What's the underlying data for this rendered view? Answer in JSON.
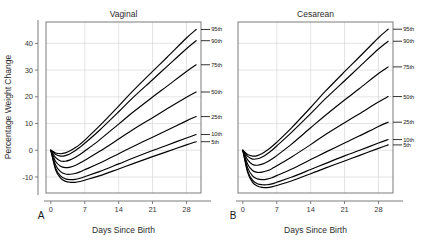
{
  "figure": {
    "background_color": "#ffffff",
    "curve_color": "#000000",
    "grid_color": "#d9d9d9",
    "axis_color": "#6e6e6e"
  },
  "panels": [
    {
      "letter": "A",
      "title": "Vaginal",
      "xlabel": "Days Since Birth",
      "ylabel": "Percentage Weight Change"
    },
    {
      "letter": "B",
      "title": "Cesarean",
      "xlabel": "Days Since Birth",
      "ylabel": ""
    }
  ],
  "chart_data": {
    "type": "line",
    "xlabel": "Days Since Birth",
    "ylabel": "Percentage Weight Change",
    "xlim": [
      -1,
      31
    ],
    "ylim": [
      -16,
      48
    ],
    "xticks": [
      0,
      7,
      14,
      21,
      28
    ],
    "yticks": [
      -10,
      0,
      10,
      20,
      30,
      40
    ],
    "grid": true,
    "legend_position": "inline-right-of-curve-ends",
    "x": [
      0,
      1,
      2,
      3,
      4,
      5,
      6,
      7,
      10,
      14,
      17,
      21,
      24,
      28,
      30
    ],
    "panels": [
      {
        "name": "Vaginal",
        "letter": "A",
        "series": [
          {
            "name": "95th",
            "label": "95th",
            "values": [
              0,
              -1.0,
              -1.3,
              -1.0,
              -0.2,
              0.9,
              2.2,
              3.8,
              9.0,
              16.5,
              22.3,
              29.5,
              34.8,
              42.0,
              45.2
            ]
          },
          {
            "name": "90th",
            "label": "90th",
            "values": [
              0,
              -1.6,
              -2.2,
              -2.0,
              -1.3,
              -0.2,
              1.1,
              2.6,
              7.4,
              14.4,
              19.8,
              26.4,
              31.4,
              38.0,
              41.0
            ]
          },
          {
            "name": "75th",
            "label": "75th",
            "values": [
              0,
              -2.8,
              -4.0,
              -4.1,
              -3.6,
              -2.7,
              -1.6,
              -0.3,
              3.8,
              9.8,
              14.3,
              19.9,
              24.0,
              29.5,
              32.0
            ]
          },
          {
            "name": "50th",
            "label": "50th",
            "values": [
              0,
              -4.2,
              -6.0,
              -6.5,
              -6.3,
              -5.7,
              -4.8,
              -3.7,
              -0.5,
              4.2,
              7.8,
              12.2,
              15.5,
              19.8,
              21.8
            ]
          },
          {
            "name": "25th",
            "label": "25th",
            "values": [
              0,
              -5.6,
              -8.0,
              -8.9,
              -9.0,
              -8.7,
              -8.1,
              -7.3,
              -4.9,
              -1.3,
              1.4,
              4.9,
              7.5,
              11.0,
              12.6
            ]
          },
          {
            "name": "10th",
            "label": "10th",
            "values": [
              0,
              -6.8,
              -9.6,
              -10.7,
              -11.0,
              -10.9,
              -10.5,
              -9.9,
              -8.0,
              -5.1,
              -2.9,
              -0.1,
              1.9,
              4.6,
              5.9
            ]
          },
          {
            "name": "5th",
            "label": "5th",
            "values": [
              0,
              -7.4,
              -10.4,
              -11.6,
              -12.0,
              -12.0,
              -11.7,
              -11.2,
              -9.6,
              -7.0,
              -5.0,
              -2.4,
              -0.5,
              2.0,
              3.2
            ]
          }
        ]
      },
      {
        "name": "Cesarean",
        "letter": "B",
        "series": [
          {
            "name": "95th",
            "label": "95th",
            "values": [
              0,
              -1.6,
              -2.2,
              -2.0,
              -1.2,
              0.0,
              1.4,
              3.0,
              8.3,
              16.0,
              22.0,
              29.4,
              34.8,
              42.1,
              45.3
            ]
          },
          {
            "name": "90th",
            "label": "90th",
            "values": [
              0,
              -2.3,
              -3.3,
              -3.2,
              -2.5,
              -1.4,
              0.0,
              1.6,
              6.6,
              13.7,
              19.2,
              26.0,
              31.1,
              37.9,
              40.8
            ]
          },
          {
            "name": "75th",
            "label": "75th",
            "values": [
              0,
              -3.6,
              -5.3,
              -5.6,
              -5.2,
              -4.4,
              -3.3,
              -2.0,
              2.2,
              8.4,
              13.0,
              18.8,
              23.0,
              28.7,
              31.2
            ]
          },
          {
            "name": "50th",
            "label": "50th",
            "values": [
              0,
              -5.2,
              -7.6,
              -8.3,
              -8.2,
              -7.7,
              -6.9,
              -5.8,
              -2.6,
              2.1,
              5.8,
              10.3,
              13.6,
              18.1,
              20.1
            ]
          },
          {
            "name": "25th",
            "label": "25th",
            "values": [
              0,
              -6.6,
              -9.6,
              -10.7,
              -11.0,
              -10.8,
              -10.3,
              -9.5,
              -7.1,
              -3.5,
              -0.8,
              2.7,
              5.3,
              8.9,
              10.5
            ]
          },
          {
            "name": "10th",
            "label": "10th",
            "values": [
              0,
              -7.8,
              -11.2,
              -12.5,
              -12.9,
              -12.9,
              -12.6,
              -12.0,
              -10.1,
              -7.2,
              -5.0,
              -2.1,
              -0.1,
              2.7,
              4.0
            ]
          },
          {
            "name": "5th",
            "label": "5th",
            "values": [
              0,
              -8.4,
              -12.0,
              -13.4,
              -13.9,
              -14.0,
              -13.7,
              -13.2,
              -11.5,
              -8.8,
              -6.7,
              -4.0,
              -2.0,
              0.7,
              2.0
            ]
          }
        ]
      }
    ]
  }
}
